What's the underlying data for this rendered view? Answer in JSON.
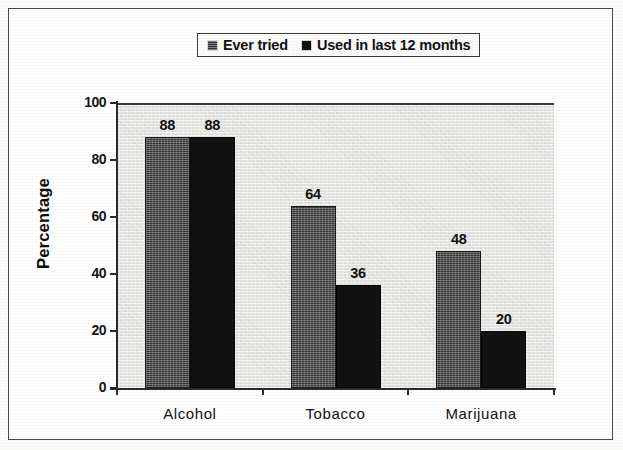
{
  "chart_data": {
    "type": "bar",
    "title": "",
    "subtitle": "",
    "xlabel": "",
    "ylabel": "Percentage",
    "categories": [
      "Alcohol",
      "Tobacco",
      "Marijuana"
    ],
    "series": [
      {
        "name": "Ever tried",
        "values": [
          88,
          64,
          48
        ],
        "color": "#333333",
        "pattern": "hatch"
      },
      {
        "name": "Used in last 12 months",
        "values": [
          88,
          36,
          20
        ],
        "color": "#121212",
        "pattern": "solid"
      }
    ],
    "ylim": [
      0,
      100
    ],
    "yticks": [
      0,
      20,
      40,
      60,
      80,
      100
    ],
    "ytick_labels": [
      "0",
      "20",
      "40",
      "60",
      "80",
      "100"
    ],
    "grid": false,
    "legend_position": "top-center",
    "data_labels": true,
    "plot_background": "#e7e7e4",
    "axis_color": "#2b2b2b"
  },
  "legend": {
    "entries": [
      {
        "label": "Ever tried",
        "swatch": "legend-swatch-hatched"
      },
      {
        "label": "Used in last 12 months",
        "swatch": "legend-swatch-solid"
      }
    ]
  },
  "axes": {
    "y_title": "Percentage"
  }
}
